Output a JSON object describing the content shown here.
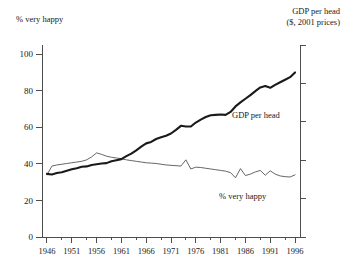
{
  "figure": {
    "left_axis_caption": "% very happy",
    "right_axis_caption_line1": "GDP per head",
    "right_axis_caption_line2": "($, 2001 prices)",
    "annotation_gdp": "GDP per head",
    "annotation_happy": "% very happy"
  },
  "chart_data": {
    "type": "line",
    "title": "",
    "subtitle": "",
    "xlabel": "",
    "ylabel": "% very happy",
    "y2label": "GDP per head ($, 2001 prices)",
    "grid": false,
    "legend": "in-plot annotations",
    "xlim": [
      1945,
      1997
    ],
    "ylim": [
      0,
      105
    ],
    "yticks": [
      0,
      20,
      40,
      60,
      80,
      100
    ],
    "xticks": [
      1946,
      1951,
      1956,
      1961,
      1966,
      1971,
      1976,
      1981,
      1986,
      1991,
      1996
    ],
    "xtick_labels": [
      "1946",
      "1951",
      "1956",
      "1961",
      "1966",
      "1971",
      "1976",
      "1981",
      "1986",
      "1991",
      "1996"
    ],
    "ytick_labels": [
      "0",
      "20",
      "40",
      "60",
      "80",
      "100"
    ],
    "y2_ticks_count": 6,
    "y2_tick_labels": [
      "",
      "",
      "",
      "",
      "",
      ""
    ],
    "colors": {
      "gdp_line": "#1a1a1a",
      "happy_line": "#555555",
      "axis": "#4d4d4d",
      "background": "#ffffff"
    },
    "x": [
      1946,
      1947,
      1948,
      1949,
      1950,
      1951,
      1952,
      1953,
      1954,
      1955,
      1956,
      1957,
      1958,
      1959,
      1960,
      1961,
      1962,
      1963,
      1964,
      1965,
      1966,
      1967,
      1968,
      1969,
      1970,
      1971,
      1972,
      1973,
      1974,
      1975,
      1976,
      1977,
      1978,
      1979,
      1980,
      1981,
      1982,
      1983,
      1984,
      1985,
      1986,
      1987,
      1988,
      1989,
      1990,
      1991,
      1992,
      1993,
      1994,
      1995,
      1996
    ],
    "series": [
      {
        "name": "GDP per head",
        "axis": "right",
        "units": "indexed to left scale",
        "values": [
          34.5,
          34.2,
          35.0,
          35.4,
          36.2,
          37.0,
          37.6,
          38.4,
          38.6,
          39.4,
          39.8,
          40.2,
          40.4,
          41.4,
          42.0,
          42.6,
          44.2,
          45.6,
          47.4,
          49.4,
          51.2,
          52.0,
          53.6,
          54.6,
          55.4,
          56.6,
          58.6,
          60.8,
          60.4,
          60.4,
          62.6,
          64.2,
          65.6,
          66.6,
          66.8,
          67.0,
          66.8,
          68.4,
          71.4,
          73.6,
          75.6,
          77.6,
          79.8,
          81.8,
          82.6,
          81.6,
          83.2,
          84.6,
          86.0,
          87.4,
          90.0
        ]
      },
      {
        "name": "% very happy",
        "axis": "left",
        "units": "percent",
        "values": [
          34.0,
          38.8,
          39.4,
          39.8,
          40.2,
          40.6,
          41.0,
          41.4,
          42.2,
          43.8,
          46.0,
          45.2,
          44.2,
          43.6,
          43.2,
          42.8,
          42.2,
          41.8,
          41.4,
          41.0,
          40.6,
          40.4,
          40.2,
          39.8,
          39.4,
          39.2,
          39.0,
          38.8,
          42.2,
          37.2,
          38.2,
          38.0,
          37.6,
          37.2,
          36.8,
          36.4,
          36.0,
          35.2,
          32.4,
          37.4,
          33.6,
          34.4,
          35.6,
          36.4,
          33.8,
          36.2,
          34.4,
          33.4,
          33.0,
          32.8,
          34.0
        ]
      }
    ]
  }
}
